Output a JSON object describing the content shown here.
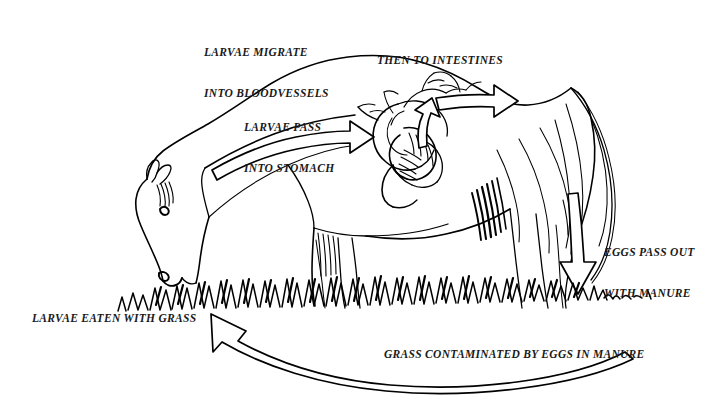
{
  "diagram": {
    "ink_color": "#000000",
    "background_color": "#ffffff",
    "labels": {
      "larvae_migrate": {
        "line1": "LARVAE MIGRATE",
        "line2": "INTO BLOODVESSELS"
      },
      "then_to_intestines": {
        "line1": "THEN TO INTESTINES"
      },
      "larvae_pass": {
        "line1": "LARVAE PASS",
        "line2": "INTO STOMACH"
      },
      "eggs_pass_out": {
        "line1": "EGGS PASS OUT",
        "line2": "WITH MANURE"
      },
      "larvae_eaten": {
        "line1": "LARVAE EATEN WITH GRASS"
      },
      "grass_contaminated": {
        "line1": "GRASS CONTAMINATED BY EGGS IN MANURE"
      }
    },
    "stages": [
      {
        "order": 1,
        "name": "larvae-eaten-with-grass",
        "text": "LARVAE EATEN WITH GRASS"
      },
      {
        "order": 2,
        "name": "larvae-pass-into-stomach",
        "text": "LARVAE PASS INTO STOMACH"
      },
      {
        "order": 3,
        "name": "larvae-migrate-into-bloodvessels",
        "text": "LARVAE MIGRATE INTO BLOODVESSELS"
      },
      {
        "order": 4,
        "name": "then-to-intestines",
        "text": "THEN TO INTESTINES"
      },
      {
        "order": 5,
        "name": "eggs-pass-out-with-manure",
        "text": "EGGS PASS OUT WITH MANURE"
      },
      {
        "order": 6,
        "name": "grass-contaminated-by-eggs-in-manure",
        "text": "GRASS CONTAMINATED BY EGGS IN MANURE"
      }
    ],
    "arrows": [
      {
        "name": "neck-arrow-to-stomach",
        "direction": "right",
        "stage": "larvae-pass-into-stomach"
      },
      {
        "name": "stomach-arrow-to-intestines",
        "direction": "right",
        "stage": "then-to-intestines"
      },
      {
        "name": "rear-arrow-down-to-grass",
        "direction": "down",
        "stage": "eggs-pass-out-with-manure"
      },
      {
        "name": "return-arrow-to-grass",
        "direction": "left",
        "stage": "grass-contaminated-by-eggs-in-manure"
      }
    ]
  }
}
